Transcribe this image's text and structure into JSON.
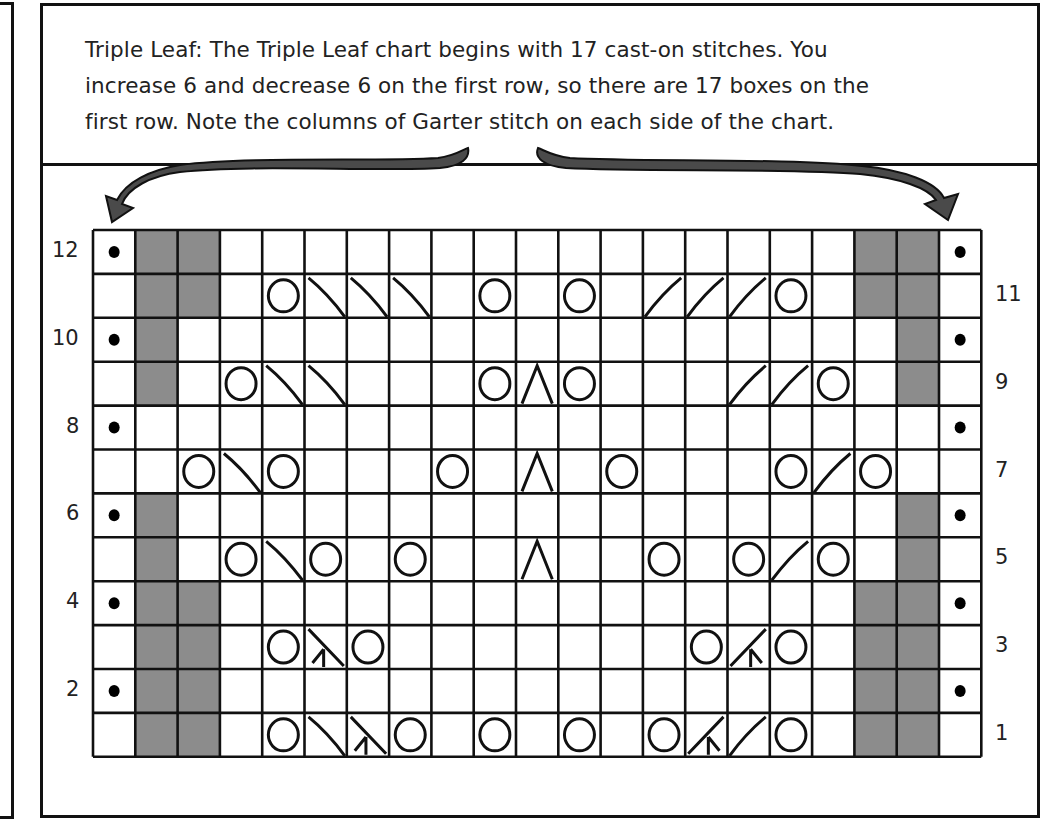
{
  "caption": "Triple Leaf: The Triple Leaf chart begins with 17 cast-on stitches. You increase 6 and decrease 6 on the first row, so there are 17 boxes on the first row. Note the columns of Garter stitch on each side of the chart.",
  "caption_lines": [
    "Triple Leaf: The Triple Leaf chart begins with 17 cast-on stitches. You",
    "increase 6 and decrease 6 on the first row, so there are 17 boxes on the",
    "first row. Note the columns of Garter stitch on each side of the chart."
  ],
  "colors": {
    "line": "#111111",
    "gray_cell": "#8c8c8c",
    "arrow": "#4a4a4a",
    "background": "#ffffff"
  },
  "grid": {
    "columns": 21,
    "rows": 12
  },
  "left_labels": [
    "12",
    "10",
    "8",
    "6",
    "4",
    "2"
  ],
  "right_labels": [
    "11",
    "9",
    "7",
    "5",
    "3",
    "1"
  ],
  "legend_symbols": {
    "p": "purl-dot",
    "g": "gray-no-stitch",
    "o": "yarn-over",
    "b": "ssk-left-slant-decrease",
    "f": "k2tog-right-slant-decrease",
    "a": "centered-double-decrease",
    "l": "left-double-decrease",
    "r": "right-double-decrease",
    ".": "knit"
  },
  "chart_rows": [
    {
      "row": 12,
      "cells": "pgg...............ggp"
    },
    {
      "row": 11,
      "cells": ".gg.obbb.o.o.fffo.gg."
    },
    {
      "row": 10,
      "cells": "pg.................gp"
    },
    {
      "row": 9,
      "cells": ".g.obb...oao...ffo.g."
    },
    {
      "row": 8,
      "cells": "p...................p"
    },
    {
      "row": 7,
      "cells": "..obo...o.a.o...ofo.."
    },
    {
      "row": 6,
      "cells": "pg.................gp"
    },
    {
      "row": 5,
      "cells": ".g.obo.o..a..o.ofo.g."
    },
    {
      "row": 4,
      "cells": "pgg...............ggp"
    },
    {
      "row": 3,
      "cells": ".gg.olo.......oro.gg."
    },
    {
      "row": 2,
      "cells": "pgg...............ggp"
    },
    {
      "row": 1,
      "cells": ".gg.oblo.o.o.orfo.gg."
    }
  ],
  "chart_data": {
    "type": "table",
    "title": "Triple Leaf",
    "rows": 12,
    "columns": 21,
    "row_numbers_left": [
      12,
      10,
      8,
      6,
      4,
      2
    ],
    "row_numbers_right": [
      11,
      9,
      7,
      5,
      3,
      1
    ],
    "cast_on_stitches": 17,
    "increases_row1": 6,
    "decreases_row1": 6
  }
}
